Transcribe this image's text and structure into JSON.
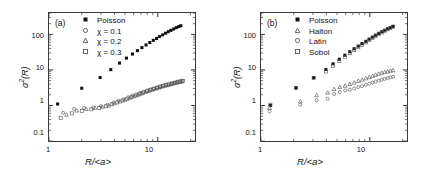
{
  "figure": {
    "background": "#ffffff",
    "ink": "#111111",
    "frame_color": "#3a3a3a"
  },
  "panels": [
    {
      "tag": "(a)",
      "xlabel": "R/<a>",
      "ylabel_sigma": "σ",
      "ylabel_exp": "2",
      "ylabel_arg": "(R)",
      "xticks": [
        "1",
        "10"
      ],
      "yticks": [
        "100",
        "10",
        "1",
        "0.1"
      ],
      "legend": [
        {
          "label": "Poisson",
          "marker": "filled-square",
          "color": "#111111"
        },
        {
          "label": "χ = 0.1",
          "marker": "open-circle",
          "color": "#555555"
        },
        {
          "label": "χ = 0.2",
          "marker": "open-triangle",
          "color": "#555555"
        },
        {
          "label": "χ = 0.3",
          "marker": "open-square",
          "color": "#555555"
        }
      ]
    },
    {
      "tag": "(b)",
      "xlabel": "R/<a>",
      "ylabel_sigma": "σ",
      "ylabel_exp": "2",
      "ylabel_arg": "(R)",
      "xticks": [
        "1",
        "10"
      ],
      "yticks": [
        "100",
        "10",
        "1",
        "0.1"
      ],
      "legend": [
        {
          "label": "Poisson",
          "marker": "filled-square",
          "color": "#111111"
        },
        {
          "label": "Halton",
          "marker": "open-triangle",
          "color": "#555555"
        },
        {
          "label": "Latin",
          "marker": "open-circle",
          "color": "#555555"
        },
        {
          "label": "Sobol",
          "marker": "open-square",
          "color": "#555555"
        }
      ]
    }
  ],
  "chart_data": [
    {
      "type": "scatter",
      "panel": "(a)",
      "title": "",
      "xlabel": "R/<a>",
      "ylabel": "sigma^2(R)",
      "xscale": "log",
      "yscale": "log",
      "xlim": [
        1,
        22
      ],
      "ylim": [
        0.1,
        400
      ],
      "grid": false,
      "legend_position": "top-left",
      "series": [
        {
          "name": "Poisson",
          "marker": "filled-square",
          "color": "#111111",
          "points": [
            [
              1.2,
              1.1
            ],
            [
              2.0,
              3.05
            ],
            [
              2.95,
              6.1
            ],
            [
              3.7,
              10.2
            ],
            [
              4.45,
              15.6
            ],
            [
              5.15,
              21.5
            ],
            [
              5.85,
              28.0
            ],
            [
              6.5,
              35.0
            ],
            [
              7.15,
              42.5
            ],
            [
              7.8,
              50.5
            ],
            [
              8.45,
              59.0
            ],
            [
              9.1,
              68.0
            ],
            [
              9.75,
              77.0
            ],
            [
              10.4,
              87.0
            ],
            [
              11.1,
              97.0
            ],
            [
              11.8,
              108
            ],
            [
              12.5,
              119
            ],
            [
              13.2,
              130
            ],
            [
              14.0,
              142
            ],
            [
              14.8,
              155
            ],
            [
              15.6,
              166
            ],
            [
              16.3,
              175
            ]
          ]
        },
        {
          "name": "chi = 0.1",
          "marker": "open-circle",
          "color": "#555555",
          "points": [
            [
              1.35,
              0.62
            ],
            [
              1.7,
              0.8
            ],
            [
              2.1,
              0.85
            ],
            [
              2.55,
              0.88
            ],
            [
              3.0,
              0.95
            ],
            [
              3.45,
              1.05
            ],
            [
              3.9,
              1.2
            ],
            [
              4.35,
              1.35
            ],
            [
              4.85,
              1.5
            ],
            [
              5.35,
              1.7
            ],
            [
              5.85,
              1.9
            ],
            [
              6.35,
              2.05
            ],
            [
              6.9,
              2.25
            ],
            [
              7.45,
              2.45
            ],
            [
              8.0,
              2.65
            ],
            [
              8.6,
              2.85
            ],
            [
              9.2,
              3.05
            ],
            [
              9.85,
              3.25
            ],
            [
              10.5,
              3.45
            ],
            [
              11.2,
              3.65
            ],
            [
              11.9,
              3.85
            ],
            [
              12.6,
              4.05
            ],
            [
              13.4,
              4.25
            ],
            [
              14.2,
              4.45
            ],
            [
              15.0,
              4.65
            ],
            [
              15.9,
              4.85
            ],
            [
              16.8,
              5.0
            ]
          ]
        },
        {
          "name": "chi = 0.2",
          "marker": "open-triangle",
          "color": "#555555",
          "points": [
            [
              1.45,
              0.55
            ],
            [
              1.8,
              0.72
            ],
            [
              2.2,
              0.8
            ],
            [
              2.65,
              0.85
            ],
            [
              3.1,
              0.92
            ],
            [
              3.55,
              1.0
            ],
            [
              4.0,
              1.15
            ],
            [
              4.5,
              1.3
            ],
            [
              5.0,
              1.45
            ],
            [
              5.5,
              1.62
            ],
            [
              6.0,
              1.8
            ],
            [
              6.55,
              1.98
            ],
            [
              7.1,
              2.18
            ],
            [
              7.7,
              2.38
            ],
            [
              8.3,
              2.58
            ],
            [
              8.9,
              2.78
            ],
            [
              9.55,
              2.98
            ],
            [
              10.2,
              3.18
            ],
            [
              10.9,
              3.38
            ],
            [
              11.6,
              3.58
            ],
            [
              12.4,
              3.78
            ],
            [
              13.2,
              3.98
            ],
            [
              14.0,
              4.18
            ],
            [
              14.9,
              4.38
            ],
            [
              15.8,
              4.58
            ],
            [
              16.7,
              4.78
            ]
          ]
        },
        {
          "name": "chi = 0.3",
          "marker": "open-square",
          "color": "#555555",
          "points": [
            [
              1.28,
              0.45
            ],
            [
              1.62,
              0.6
            ],
            [
              2.0,
              0.7
            ],
            [
              2.45,
              0.78
            ],
            [
              2.9,
              0.86
            ],
            [
              3.35,
              0.95
            ],
            [
              3.8,
              1.08
            ],
            [
              4.25,
              1.22
            ],
            [
              4.75,
              1.38
            ],
            [
              5.25,
              1.55
            ],
            [
              5.75,
              1.72
            ],
            [
              6.25,
              1.9
            ],
            [
              6.8,
              2.1
            ],
            [
              7.35,
              2.3
            ],
            [
              7.95,
              2.5
            ],
            [
              8.55,
              2.7
            ],
            [
              9.15,
              2.9
            ],
            [
              9.8,
              3.1
            ],
            [
              10.5,
              3.3
            ],
            [
              11.2,
              3.5
            ],
            [
              11.9,
              3.7
            ],
            [
              12.7,
              3.9
            ],
            [
              13.5,
              4.1
            ],
            [
              14.3,
              4.3
            ],
            [
              15.2,
              4.5
            ],
            [
              16.1,
              4.7
            ],
            [
              17.0,
              4.9
            ]
          ]
        }
      ]
    },
    {
      "type": "scatter",
      "panel": "(b)",
      "title": "",
      "xlabel": "R/<a>",
      "ylabel": "sigma^2(R)",
      "xscale": "log",
      "yscale": "log",
      "xlim": [
        1,
        22
      ],
      "ylim": [
        0.1,
        400
      ],
      "grid": false,
      "legend_position": "top-left",
      "series": [
        {
          "name": "Poisson",
          "marker": "filled-square",
          "color": "#111111",
          "points": [
            [
              1.22,
              1.0
            ],
            [
              2.1,
              3.15
            ],
            [
              3.05,
              6.1
            ],
            [
              3.95,
              10.3
            ],
            [
              4.6,
              14.8
            ],
            [
              5.25,
              20.0
            ],
            [
              5.9,
              26.0
            ],
            [
              6.55,
              32.5
            ],
            [
              7.2,
              39.5
            ],
            [
              7.85,
              47.0
            ],
            [
              8.5,
              55.0
            ],
            [
              9.2,
              64.0
            ],
            [
              9.9,
              73.5
            ],
            [
              10.6,
              84.0
            ],
            [
              11.3,
              95.0
            ],
            [
              12.1,
              107
            ],
            [
              12.9,
              119
            ],
            [
              13.7,
              131
            ],
            [
              14.6,
              144
            ],
            [
              15.5,
              157
            ],
            [
              16.4,
              168
            ]
          ]
        },
        {
          "name": "Sobol",
          "marker": "open-square",
          "color": "#555555",
          "points": [
            [
              1.22,
              1.05
            ],
            [
              2.1,
              3.1
            ],
            [
              3.05,
              5.95
            ],
            [
              3.95,
              9.0
            ],
            [
              4.6,
              13.0
            ],
            [
              5.25,
              18.0
            ],
            [
              5.9,
              23.5
            ],
            [
              6.55,
              29.5
            ],
            [
              7.2,
              36.0
            ],
            [
              7.85,
              43.5
            ],
            [
              8.5,
              51.0
            ],
            [
              9.2,
              59.5
            ],
            [
              9.9,
              69.0
            ],
            [
              10.6,
              79.0
            ],
            [
              11.3,
              90.0
            ],
            [
              12.1,
              101
            ],
            [
              12.9,
              113
            ],
            [
              13.7,
              126
            ],
            [
              14.6,
              139
            ],
            [
              15.5,
              152
            ],
            [
              16.4,
              165
            ]
          ]
        },
        {
          "name": "Halton",
          "marker": "open-triangle",
          "color": "#555555",
          "points": [
            [
              1.2,
              0.85
            ],
            [
              2.3,
              1.3
            ],
            [
              3.25,
              1.95
            ],
            [
              4.1,
              2.3
            ],
            [
              4.7,
              2.9
            ],
            [
              5.3,
              3.3
            ],
            [
              5.95,
              3.6
            ],
            [
              6.55,
              4.0
            ],
            [
              7.2,
              4.4
            ],
            [
              7.85,
              4.9
            ],
            [
              8.5,
              5.3
            ],
            [
              9.2,
              5.8
            ],
            [
              9.9,
              6.3
            ],
            [
              10.6,
              6.8
            ],
            [
              11.3,
              7.3
            ],
            [
              12.1,
              7.8
            ],
            [
              12.9,
              8.3
            ],
            [
              13.7,
              8.7
            ],
            [
              14.6,
              9.1
            ],
            [
              15.5,
              9.5
            ],
            [
              16.4,
              9.8
            ]
          ]
        },
        {
          "name": "Latin",
          "marker": "open-circle",
          "color": "#555555",
          "points": [
            [
              1.2,
              0.68
            ],
            [
              2.3,
              1.05
            ],
            [
              3.25,
              1.4
            ],
            [
              4.1,
              1.55
            ],
            [
              4.7,
              2.1
            ],
            [
              5.3,
              2.4
            ],
            [
              5.95,
              2.65
            ],
            [
              6.55,
              2.8
            ],
            [
              7.2,
              3.0
            ],
            [
              7.85,
              3.3
            ],
            [
              8.5,
              3.5
            ],
            [
              9.2,
              3.8
            ],
            [
              9.9,
              4.1
            ],
            [
              10.6,
              4.4
            ],
            [
              11.3,
              4.7
            ],
            [
              12.1,
              5.0
            ],
            [
              12.9,
              5.3
            ],
            [
              13.7,
              5.6
            ],
            [
              14.6,
              5.9
            ],
            [
              15.5,
              6.2
            ],
            [
              16.4,
              6.4
            ]
          ]
        }
      ]
    }
  ]
}
